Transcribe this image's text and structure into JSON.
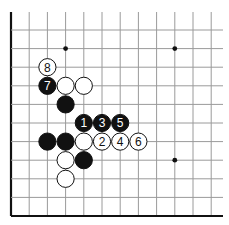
{
  "diagram": {
    "type": "go-board-fragment",
    "grid": {
      "columns_x": [
        11,
        29.2,
        47.4,
        65.6,
        83.8,
        102,
        120.2,
        138.4,
        156.6,
        174.8,
        193,
        211.2
      ],
      "rows_y": [
        30,
        48.6,
        67.2,
        85.8,
        104.4,
        123,
        141.6,
        160.2,
        178.8,
        197.4,
        216
      ],
      "top_extent": 12,
      "right_extent": 223,
      "line_color": "#9a9a9a",
      "border_color": "#111111"
    },
    "edges": [
      "left",
      "bottom"
    ],
    "star_points": [
      {
        "col": 3,
        "row": 1
      },
      {
        "col": 9,
        "row": 1
      },
      {
        "col": 9,
        "row": 7
      }
    ],
    "stones": [
      {
        "color": "white",
        "col": 2,
        "row": 2,
        "label": "8"
      },
      {
        "color": "black",
        "col": 2,
        "row": 3,
        "label": "7"
      },
      {
        "color": "white",
        "col": 3,
        "row": 3,
        "label": ""
      },
      {
        "color": "white",
        "col": 4,
        "row": 3,
        "label": ""
      },
      {
        "color": "black",
        "col": 3,
        "row": 4,
        "label": ""
      },
      {
        "color": "black",
        "col": 4,
        "row": 5,
        "label": "1"
      },
      {
        "color": "black",
        "col": 5,
        "row": 5,
        "label": "3"
      },
      {
        "color": "black",
        "col": 6,
        "row": 5,
        "label": "5"
      },
      {
        "color": "black",
        "col": 2,
        "row": 6,
        "label": ""
      },
      {
        "color": "black",
        "col": 3,
        "row": 6,
        "label": ""
      },
      {
        "color": "white",
        "col": 4,
        "row": 6,
        "label": ""
      },
      {
        "color": "white",
        "col": 5,
        "row": 6,
        "label": "2"
      },
      {
        "color": "white",
        "col": 6,
        "row": 6,
        "label": "4"
      },
      {
        "color": "white",
        "col": 7,
        "row": 6,
        "label": "6"
      },
      {
        "color": "white",
        "col": 3,
        "row": 7,
        "label": ""
      },
      {
        "color": "black",
        "col": 4,
        "row": 7,
        "label": ""
      },
      {
        "color": "white",
        "col": 3,
        "row": 8,
        "label": ""
      }
    ]
  }
}
